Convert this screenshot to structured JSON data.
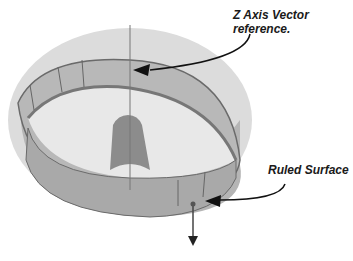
{
  "figure": {
    "colors": {
      "outer_surface": "#d9d9d9",
      "wall": "#a8a8a8",
      "inner_floor": "#e6e6e6",
      "boss": "#8a8a8a",
      "edge": "#6a6a6a",
      "arrow": "#111111"
    }
  },
  "callouts": [
    {
      "id": "z-axis",
      "line1": "Z Axis Vector",
      "line2": "reference."
    },
    {
      "id": "ruled-surface",
      "line1": "Ruled Surface"
    }
  ]
}
